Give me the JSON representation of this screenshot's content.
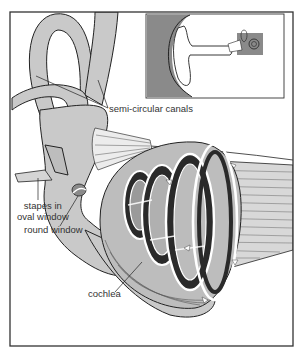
{
  "figure": {
    "style": "monochrome illustration",
    "colors": {
      "background": "#ffffff",
      "frame": "#333333",
      "bone_fill": "#c9c9c9",
      "inset_bg": "#8a8a8a",
      "outline": "#222222",
      "dark_fill": "#2a2a2a",
      "fluid_arrows": "#ffffff"
    }
  },
  "labels": {
    "semicircular_canals": "semi-circular canals",
    "stapes_line1": "stapes in",
    "stapes_line2": "oval window",
    "round_window": "round window",
    "cochlea": "cochlea"
  },
  "inset": {
    "description": "outer ear with location of inner ear highlighted"
  }
}
